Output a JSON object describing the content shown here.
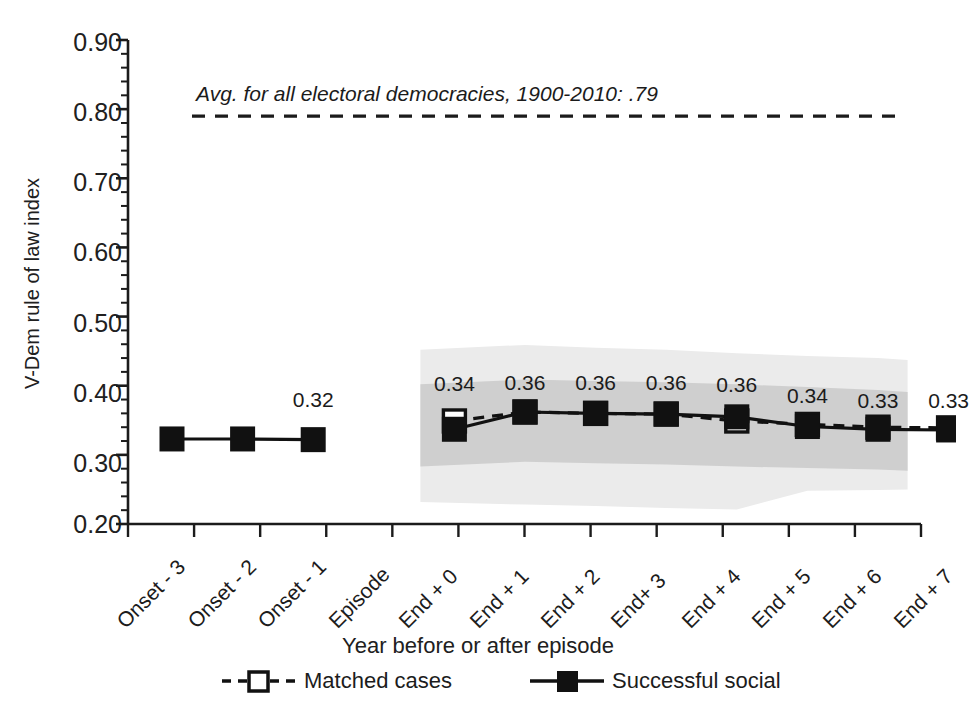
{
  "chart_data": {
    "type": "line",
    "title": "",
    "xlabel": "Year before or after episode",
    "ylabel": "V-Dem rule of law index",
    "ylim": [
      0.2,
      0.9
    ],
    "ytick_labels": [
      "0.90",
      "0.80",
      "0.70",
      "0.60",
      "0.50",
      "0.40",
      "0.30",
      "0.20"
    ],
    "ytick_values": [
      0.9,
      0.8,
      0.7,
      0.6,
      0.5,
      0.4,
      0.3,
      0.2
    ],
    "minor_tick_step": 0.02,
    "grid": false,
    "legend_position": "bottom",
    "categories": [
      "Onset - 3",
      "Onset - 2",
      "Onset - 1",
      "Episode",
      "End + 0",
      "End + 1",
      "End + 2",
      "End+ 3",
      "End + 4",
      "End + 5",
      "End + 6",
      "End + 7"
    ],
    "series": [
      {
        "name": "Successful social",
        "marker": "filled-square",
        "line": "solid",
        "color": "#111111",
        "values": [
          0.323,
          0.323,
          0.322,
          null,
          0.337,
          0.362,
          0.36,
          0.359,
          0.355,
          0.341,
          0.337,
          0.336
        ]
      },
      {
        "name": "Matched cases",
        "marker": "open-square",
        "line": "dashed",
        "color": "#111111",
        "values": [
          null,
          null,
          null,
          null,
          0.349,
          0.362,
          0.36,
          0.359,
          0.349,
          0.344,
          0.34,
          0.339
        ]
      }
    ],
    "point_labels": [
      {
        "category": "Onset - 1",
        "text": "0.32"
      },
      {
        "category": "End + 0",
        "text": "0.34"
      },
      {
        "category": "End + 1",
        "text": "0.36"
      },
      {
        "category": "End + 2",
        "text": "0.36"
      },
      {
        "category": "End+ 3",
        "text": "0.36"
      },
      {
        "category": "End + 4",
        "text": "0.36"
      },
      {
        "category": "End + 5",
        "text": "0.34"
      },
      {
        "category": "End + 6",
        "text": "0.33"
      },
      {
        "category": "End + 7",
        "text": "0.33"
      }
    ],
    "reference_line": {
      "value": 0.79,
      "style": "dashed",
      "label": "Avg. for all electoral democracies, 1900-2010: .79"
    },
    "bands": [
      {
        "name": "outer-confidence-band",
        "color": "#ebebeb",
        "upper": [
          0.452,
          0.459,
          0.455,
          0.452,
          0.447,
          0.443,
          0.44,
          0.437
        ],
        "lower": [
          0.232,
          0.228,
          0.226,
          0.223,
          0.221,
          0.248,
          0.249,
          0.25
        ]
      },
      {
        "name": "inner-confidence-band",
        "color": "#cfcfcf",
        "upper": [
          0.402,
          0.409,
          0.407,
          0.405,
          0.402,
          0.398,
          0.394,
          0.391
        ],
        "lower": [
          0.283,
          0.29,
          0.288,
          0.286,
          0.283,
          0.281,
          0.279,
          0.277
        ]
      }
    ]
  },
  "legend": {
    "items": [
      {
        "label": "Matched cases",
        "marker": "open-square",
        "line": "dashed"
      },
      {
        "label": "Successful social",
        "marker": "filled-square",
        "line": "solid"
      }
    ]
  },
  "axis": {
    "y_label": "V-Dem rule of law index",
    "x_label": "Year before or after episode",
    "y_ticks": [
      "0.90",
      "0.80",
      "0.70",
      "0.60",
      "0.50",
      "0.40",
      "0.30",
      "0.20"
    ],
    "x_ticks": [
      "Onset - 3",
      "Onset - 2",
      "Onset - 1",
      "Episode",
      "End + 0",
      "End + 1",
      "End + 2",
      "End+ 3",
      "End + 4",
      "End + 5",
      "End + 6",
      "End + 7"
    ]
  },
  "annotation": {
    "reference_text": "Avg. for all electoral democracies, 1900-2010: .79"
  },
  "data_labels": {
    "onset_minus_1": "0.32",
    "end_0": "0.34",
    "end_1": "0.36",
    "end_2": "0.36",
    "end_3": "0.36",
    "end_4": "0.36",
    "end_5": "0.34",
    "end_6": "0.33",
    "end_7": "0.33"
  },
  "colors": {
    "ink": "#111111",
    "band_outer": "#ebebeb",
    "band_inner": "#cfcfcf",
    "text": "#1c1c1c"
  }
}
